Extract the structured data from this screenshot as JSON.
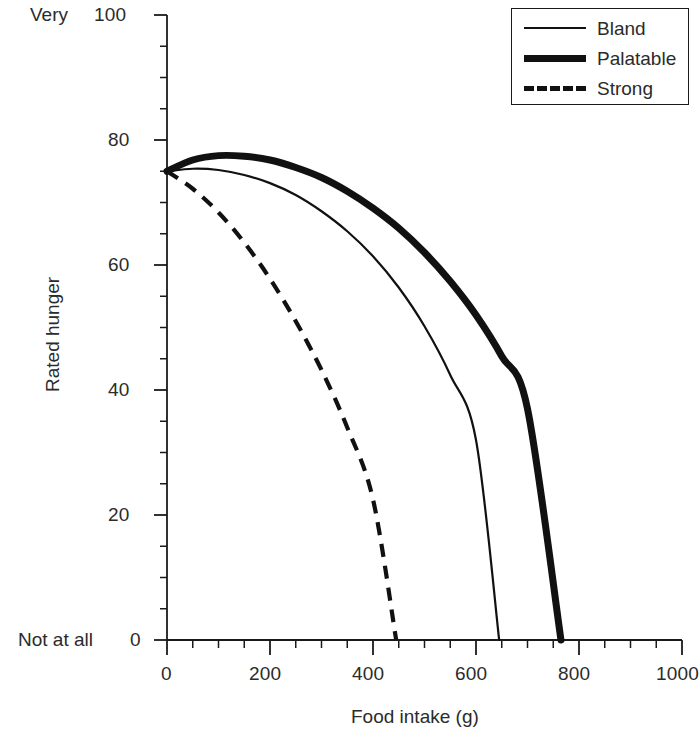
{
  "chart_data": {
    "type": "line",
    "title": "",
    "subtitle": "",
    "xlabel": "Food intake (g)",
    "ylabel": "Rated hunger",
    "xlim": [
      0,
      1000
    ],
    "ylim": [
      0,
      100
    ],
    "grid": false,
    "x_ticks": [
      0,
      200,
      400,
      600,
      800,
      1000
    ],
    "x_tick_labels": [
      "0",
      "200",
      "400",
      "600",
      "800",
      "1000"
    ],
    "x_minor_tick_interval": 50,
    "y_ticks": [
      0,
      20,
      40,
      60,
      80,
      100
    ],
    "y_tick_labels": [
      "0",
      "20",
      "40",
      "60",
      "80",
      "100"
    ],
    "y_minor_tick_interval": 5,
    "y_axis_anchor_high": "Very",
    "y_axis_anchor_low": "Not at all",
    "legend_position": "top-right",
    "legend_entries": [
      "Bland",
      "Palatable",
      "Strong"
    ],
    "series": [
      {
        "name": "Bland",
        "style": "thin-solid",
        "color": "#111111",
        "line_width": 2.2,
        "x": [
          0,
          50,
          100,
          150,
          200,
          250,
          300,
          350,
          400,
          450,
          500,
          550,
          600,
          645
        ],
        "values": [
          75,
          75.4,
          75.2,
          74.4,
          73.1,
          71.2,
          68.6,
          65.4,
          61.4,
          56.4,
          50.2,
          42.4,
          32.0,
          0
        ]
      },
      {
        "name": "Palatable",
        "style": "thick-solid",
        "color": "#111111",
        "line_width": 7,
        "x": [
          0,
          50,
          100,
          150,
          200,
          250,
          300,
          350,
          400,
          450,
          500,
          550,
          600,
          650,
          700,
          765
        ],
        "values": [
          75,
          76.8,
          77.5,
          77.4,
          76.8,
          75.6,
          74.0,
          71.8,
          69.1,
          65.9,
          62.0,
          57.4,
          52.0,
          45.4,
          37.0,
          0
        ]
      },
      {
        "name": "Strong",
        "style": "dashed",
        "color": "#111111",
        "line_width": 4.2,
        "x": [
          0,
          50,
          100,
          150,
          200,
          250,
          300,
          350,
          400,
          445
        ],
        "values": [
          75,
          72.2,
          68.4,
          63.6,
          57.8,
          51.0,
          43.2,
          34.0,
          22.5,
          0
        ]
      }
    ],
    "annotations": []
  },
  "axes": {
    "y_anchor_top": "Very",
    "y_anchor_bottom": "Not at all",
    "y_title": "Rated hunger",
    "x_title": "Food intake (g)"
  },
  "legend": {
    "items": [
      {
        "label": "Bland",
        "sample": "thin-solid-line-swatch"
      },
      {
        "label": "Palatable",
        "sample": "thick-solid-line-swatch"
      },
      {
        "label": "Strong",
        "sample": "dashed-line-swatch"
      }
    ]
  }
}
